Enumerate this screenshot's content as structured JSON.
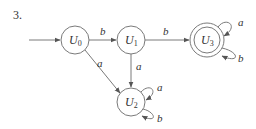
{
  "problem_number": "3.",
  "states": [
    {
      "id": "U0",
      "name": "U",
      "sub": "0",
      "start": true,
      "accepting": false
    },
    {
      "id": "U1",
      "name": "U",
      "sub": "1",
      "start": false,
      "accepting": false
    },
    {
      "id": "U2",
      "name": "U",
      "sub": "2",
      "start": false,
      "accepting": false
    },
    {
      "id": "U3",
      "name": "U",
      "sub": "3",
      "start": false,
      "accepting": true
    }
  ],
  "transitions": [
    {
      "from": "U0",
      "to": "U1",
      "label": "b"
    },
    {
      "from": "U0",
      "to": "U2",
      "label": "a"
    },
    {
      "from": "U1",
      "to": "U3",
      "label": "b"
    },
    {
      "from": "U1",
      "to": "U2",
      "label": "a"
    },
    {
      "from": "U2",
      "to": "U2",
      "label": "a"
    },
    {
      "from": "U2",
      "to": "U2",
      "label": "b"
    },
    {
      "from": "U3",
      "to": "U3",
      "label": "a"
    },
    {
      "from": "U3",
      "to": "U3",
      "label": "b"
    }
  ],
  "colors": {
    "stroke": "#7a7a7a",
    "text": "#333333",
    "background": "#ffffff"
  }
}
